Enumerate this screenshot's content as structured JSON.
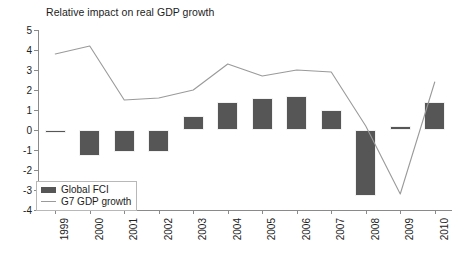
{
  "chart_data": {
    "type": "bar",
    "title": "Relative impact on real GDP growth",
    "xlabel": "",
    "ylabel": "",
    "ylim": [
      -4,
      5
    ],
    "yticks": [
      5,
      4,
      3,
      2,
      1,
      0,
      -1,
      -2,
      -3,
      -4
    ],
    "ytick_labels": [
      "5",
      "4",
      "3",
      "2",
      "1",
      "0",
      "-1",
      "-2",
      "-3",
      "-4"
    ],
    "grid": false,
    "legend_position": "bottom-left",
    "categories": [
      "1999",
      "2000",
      "2001",
      "2002",
      "2003",
      "2004",
      "2005",
      "2006",
      "2007",
      "2008",
      "2009",
      "2010"
    ],
    "series": [
      {
        "name": "Global FCI",
        "type": "bar",
        "color": "#565656",
        "values": [
          0.0,
          -1.3,
          -1.1,
          -1.1,
          0.7,
          1.4,
          1.6,
          1.7,
          1.0,
          -3.3,
          0.2,
          1.4
        ]
      },
      {
        "name": "G7 GDP growth",
        "type": "line",
        "color": "#9a9a9a",
        "values": [
          3.8,
          4.2,
          1.5,
          1.6,
          2.0,
          3.3,
          2.7,
          3.0,
          2.9,
          0.2,
          -3.2,
          2.4
        ]
      }
    ]
  },
  "legend": {
    "items": [
      {
        "label": "Global FCI",
        "marker": "bar-swatch"
      },
      {
        "label": "G7 GDP growth",
        "marker": "line-swatch"
      }
    ]
  }
}
